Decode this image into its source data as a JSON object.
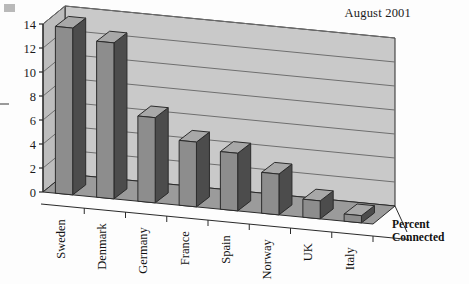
{
  "chart_data": {
    "type": "bar",
    "title": "August 2001",
    "xlabel": "",
    "ylabel": "Percent Connected",
    "ylabel_lines": [
      "Percent",
      "Connected"
    ],
    "categories": [
      "Sweden",
      "Denmark",
      "Germany",
      "France",
      "Spain",
      "Norway",
      "UK",
      "Italy"
    ],
    "values": [
      13.9,
      13.0,
      7.1,
      5.4,
      4.8,
      3.4,
      1.5,
      0.6
    ],
    "ylim": [
      0,
      14
    ],
    "yticks": [
      0,
      2,
      4,
      6,
      8,
      10,
      12,
      14
    ],
    "ytick_labels": [
      "0",
      "2",
      "4",
      "6",
      "8",
      "10",
      "12",
      "14"
    ],
    "grid": true,
    "legend": null,
    "style": "3d-column",
    "colors": {
      "bar_face": "#8d8d8d",
      "bar_side": "#4c4c4c",
      "bar_top": "#a8a8a8",
      "wall": "#c9c9c9",
      "floor": "#9b9b9b",
      "outline": "#2b2b2b",
      "gridline": "#6f6f6f",
      "text": "#111111",
      "background": "#fdfdfd"
    }
  },
  "annotations": {
    "artifact_corner": "scan-artifact-block",
    "artifact_dash": "scan-artifact-dash"
  }
}
